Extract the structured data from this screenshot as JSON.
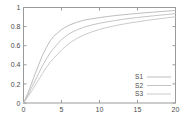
{
  "chart_data": {
    "type": "line",
    "title": "",
    "xlabel": "",
    "ylabel": "",
    "xlim": [
      0,
      20
    ],
    "ylim": [
      0,
      1
    ],
    "grid": false,
    "legend_position": "bottom-right",
    "xticks": [
      "0",
      "5",
      "10",
      "15",
      "20"
    ],
    "xtick_values": [
      0,
      5,
      10,
      15,
      20
    ],
    "yticks": [
      "0",
      "0.2",
      "0.4",
      "0.6",
      "0.8",
      "1"
    ],
    "ytick_values": [
      0,
      0.2,
      0.4,
      0.6,
      0.8,
      1
    ],
    "x": [
      0,
      0.5,
      1,
      1.5,
      2,
      2.5,
      3,
      3.5,
      4,
      5,
      6,
      7,
      8,
      9,
      10,
      11,
      12,
      13,
      14,
      15,
      16,
      17,
      18,
      19,
      20
    ],
    "series": [
      {
        "name": "S1",
        "color": "#b5b5b5",
        "values": [
          0.0,
          0.09,
          0.19,
          0.3,
          0.4,
          0.5,
          0.58,
          0.65,
          0.7,
          0.77,
          0.815,
          0.845,
          0.868,
          0.882,
          0.894,
          0.905,
          0.915,
          0.923,
          0.931,
          0.938,
          0.945,
          0.951,
          0.957,
          0.963,
          0.968
        ]
      },
      {
        "name": "S2",
        "color": "#bdbdbd",
        "values": [
          0.0,
          0.07,
          0.15,
          0.23,
          0.31,
          0.39,
          0.46,
          0.525,
          0.575,
          0.665,
          0.725,
          0.765,
          0.795,
          0.817,
          0.835,
          0.85,
          0.863,
          0.875,
          0.886,
          0.895,
          0.904,
          0.912,
          0.92,
          0.928,
          0.936
        ]
      },
      {
        "name": "S3",
        "color": "#c4c4c4",
        "values": [
          0.0,
          0.055,
          0.115,
          0.18,
          0.245,
          0.31,
          0.37,
          0.425,
          0.47,
          0.555,
          0.625,
          0.675,
          0.715,
          0.745,
          0.77,
          0.791,
          0.809,
          0.824,
          0.838,
          0.85,
          0.862,
          0.873,
          0.883,
          0.893,
          0.903
        ]
      }
    ],
    "axis_color": "#9a9a9a",
    "background_color": "#ffffff"
  },
  "legend": {
    "entries": [
      {
        "label": "S1"
      },
      {
        "label": "S2"
      },
      {
        "label": "S3"
      }
    ]
  }
}
